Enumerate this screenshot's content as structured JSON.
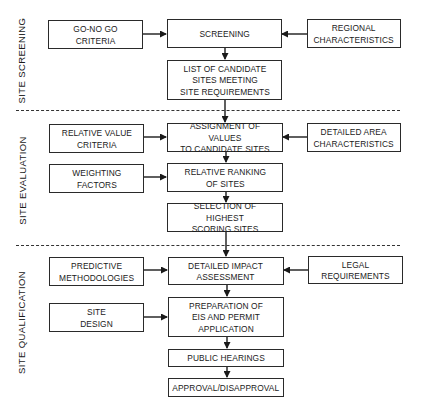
{
  "phases": [
    {
      "label": "SITE SCREENING"
    },
    {
      "label": "SITE EVALUATION"
    },
    {
      "label": "SITE QUALIFICATION"
    }
  ],
  "inputs": {
    "go_no_go": "GO-NO GO CRITERIA",
    "regional": "REGIONAL\nCHARACTERISTICS",
    "relative_value": "RELATIVE VALUE\nCRITERIA",
    "detailed_area": "DETAILED AREA\nCHARACTERISTICS",
    "weighting": "WEIGHTING\nFACTORS",
    "predictive": "PREDICTIVE\nMETHODOLOGIES",
    "legal": "LEGAL REQUIREMENTS",
    "site_design": "SITE\nDESIGN"
  },
  "steps": {
    "screening": "SCREENING",
    "list_candidates": "LIST OF CANDIDATE\nSITES MEETING\nSITE REQUIREMENTS",
    "assignment": "ASSIGNMENT OF VALUES\nTO CANDIDATE SITES",
    "ranking": "RELATIVE RANKING\nOF SITES",
    "selection": "SELECTION OF HIGHEST\nSCORING SITES",
    "impact": "DETAILED IMPACT\nASSESSMENT",
    "preparation": "PREPARATION OF\nEIS AND PERMIT\nAPPLICATION",
    "hearings": "PUBLIC HEARINGS",
    "approval": "APPROVAL/DISAPPROVAL"
  },
  "colors": {
    "line": "#2a2a2a",
    "background": "#ffffff"
  }
}
